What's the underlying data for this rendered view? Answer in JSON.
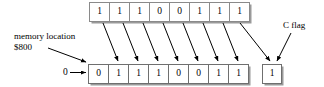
{
  "diagram": {
    "colors": {
      "outline": "#000000",
      "cell_border": "#808080",
      "shadow": "#9a9a9a",
      "text": "#000000",
      "background": "#ffffff"
    },
    "labels": {
      "memory_location_line1": "memory location",
      "memory_location_line2": "$800",
      "c_flag": "C flag",
      "zero_input": "0"
    },
    "source_register": {
      "name": "source-bits-row",
      "bit_count": 8,
      "bits": [
        "1",
        "1",
        "1",
        "0",
        "0",
        "1",
        "1",
        "1"
      ]
    },
    "destination_register": {
      "name": "result-bits-row",
      "bit_count": 8,
      "bits": [
        "0",
        "1",
        "1",
        "1",
        "0",
        "0",
        "1",
        "1"
      ]
    },
    "carry_flag": {
      "name": "c-flag-box",
      "value": "1"
    }
  }
}
